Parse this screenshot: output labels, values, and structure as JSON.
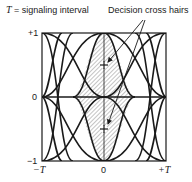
{
  "annotation": {
    "definition_symbol": "T",
    "definition_text": " = signaling interval",
    "crosshair_label": "Decision cross hairs"
  },
  "axes": {
    "y_ticks": [
      "+1",
      "0",
      "−1"
    ],
    "x_ticks": [
      "−T",
      "0",
      "+T"
    ]
  },
  "diagram": {
    "type": "eye-pattern",
    "levels": [
      1,
      0,
      -1
    ],
    "x_range": [
      "-T",
      "+T"
    ],
    "eye_openings": 2,
    "hatched_regions": [
      "upper eye",
      "lower eye"
    ],
    "crosshairs": [
      {
        "name": "upper",
        "level": 0.5,
        "x": 0
      },
      {
        "name": "lower",
        "level": -0.5,
        "x": 0
      }
    ],
    "line_color": "#1a1a1a",
    "hatch_color": "#8a8a8a"
  }
}
